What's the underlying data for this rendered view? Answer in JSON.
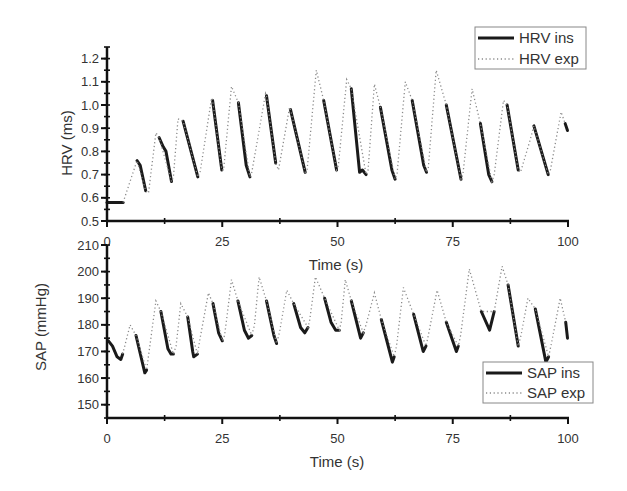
{
  "chart_data": [
    {
      "type": "line",
      "title": "",
      "xlabel": "Time (s)",
      "ylabel": "HRV (ms)",
      "xlim": [
        0,
        100
      ],
      "ylim": [
        0.5,
        1.25
      ],
      "x_ticks": [
        "0",
        "25",
        "50",
        "75",
        "100"
      ],
      "y_ticks": [
        "0.5",
        "0.6",
        "0.7",
        "0.8",
        "0.9",
        "1.0",
        "1.1",
        "1.2"
      ],
      "grid": false,
      "legend_position": "top-right",
      "series": [
        {
          "name": "HRV ins",
          "style": "solid",
          "segments": [
            [
              [
                0,
                0.58
              ],
              [
                3.5,
                0.58
              ]
            ],
            [
              [
                6.5,
                0.76
              ],
              [
                7.2,
                0.74
              ],
              [
                8.4,
                0.63
              ]
            ],
            [
              [
                11.3,
                0.86
              ],
              [
                12.2,
                0.82
              ],
              [
                12.8,
                0.8
              ],
              [
                14.0,
                0.67
              ]
            ],
            [
              [
                16.5,
                0.93
              ],
              [
                19.7,
                0.69
              ]
            ],
            [
              [
                22.9,
                1.02
              ],
              [
                24.9,
                0.72
              ]
            ],
            [
              [
                28.5,
                1.01
              ],
              [
                30.2,
                0.74
              ],
              [
                31.0,
                0.69
              ]
            ],
            [
              [
                34.6,
                1.04
              ],
              [
                36.6,
                0.75
              ]
            ],
            [
              [
                39.8,
                0.98
              ],
              [
                43.0,
                0.71
              ]
            ],
            [
              [
                47.0,
                1.02
              ],
              [
                49.8,
                0.72
              ]
            ],
            [
              [
                53.0,
                1.07
              ],
              [
                54.8,
                0.71
              ],
              [
                55.4,
                0.72
              ],
              [
                56.2,
                0.7
              ]
            ],
            [
              [
                59.3,
                0.99
              ],
              [
                61.8,
                0.72
              ],
              [
                62.5,
                0.68
              ]
            ],
            [
              [
                66.2,
                1.02
              ],
              [
                68.7,
                0.74
              ],
              [
                69.3,
                0.71
              ]
            ],
            [
              [
                73.6,
                1.0
              ],
              [
                76.8,
                0.68
              ]
            ],
            [
              [
                81.0,
                0.92
              ],
              [
                82.8,
                0.7
              ],
              [
                83.5,
                0.67
              ]
            ],
            [
              [
                86.8,
                1.0
              ],
              [
                89.2,
                0.72
              ]
            ],
            [
              [
                92.6,
                0.91
              ],
              [
                95.7,
                0.7
              ]
            ],
            [
              [
                99.4,
                0.92
              ],
              [
                99.9,
                0.89
              ]
            ]
          ]
        },
        {
          "name": "HRV exp",
          "style": "dotted",
          "points": [
            [
              3.5,
              0.58
            ],
            [
              6.5,
              0.76
            ],
            [
              8.4,
              0.63
            ],
            [
              9.0,
              0.62
            ],
            [
              10.6,
              0.88
            ],
            [
              11.3,
              0.86
            ],
            [
              14.0,
              0.67
            ],
            [
              14.4,
              0.69
            ],
            [
              15.4,
              0.94
            ],
            [
              16.5,
              0.93
            ],
            [
              19.7,
              0.69
            ],
            [
              20.2,
              0.71
            ],
            [
              22.7,
              1.03
            ],
            [
              22.9,
              1.02
            ],
            [
              24.9,
              0.72
            ],
            [
              25.3,
              0.72
            ],
            [
              27.0,
              1.08
            ],
            [
              28.5,
              1.01
            ],
            [
              31.0,
              0.69
            ],
            [
              31.4,
              0.71
            ],
            [
              34.4,
              1.05
            ],
            [
              34.6,
              1.04
            ],
            [
              36.6,
              0.75
            ],
            [
              37.2,
              0.72
            ],
            [
              39.6,
              0.99
            ],
            [
              39.8,
              0.98
            ],
            [
              43.0,
              0.71
            ],
            [
              43.4,
              0.72
            ],
            [
              45.4,
              1.15
            ],
            [
              47.0,
              1.02
            ],
            [
              49.8,
              0.72
            ],
            [
              50.2,
              0.74
            ],
            [
              52.0,
              1.11
            ],
            [
              53.0,
              1.07
            ],
            [
              56.2,
              0.7
            ],
            [
              56.6,
              0.71
            ],
            [
              58.0,
              1.09
            ],
            [
              59.3,
              0.99
            ],
            [
              62.5,
              0.68
            ],
            [
              62.9,
              0.7
            ],
            [
              64.7,
              1.1
            ],
            [
              66.2,
              1.02
            ],
            [
              69.3,
              0.71
            ],
            [
              69.7,
              0.73
            ],
            [
              71.4,
              1.15
            ],
            [
              73.6,
              1.0
            ],
            [
              76.8,
              0.68
            ],
            [
              77.2,
              0.7
            ],
            [
              79.2,
              1.07
            ],
            [
              81.0,
              0.92
            ],
            [
              83.5,
              0.67
            ],
            [
              84.0,
              0.7
            ],
            [
              86.0,
              1.02
            ],
            [
              86.8,
              1.0
            ],
            [
              89.2,
              0.72
            ],
            [
              89.7,
              0.71
            ],
            [
              91.8,
              0.85
            ],
            [
              92.6,
              0.91
            ],
            [
              95.7,
              0.7
            ],
            [
              96.1,
              0.71
            ],
            [
              98.5,
              0.97
            ],
            [
              99.4,
              0.92
            ]
          ]
        }
      ]
    },
    {
      "type": "line",
      "title": "",
      "xlabel": "Time (s)",
      "ylabel": "SAP (mmHg)",
      "xlim": [
        0,
        100
      ],
      "ylim": [
        145,
        210
      ],
      "x_ticks": [
        "0",
        "25",
        "50",
        "75",
        "100"
      ],
      "y_ticks": [
        "150",
        "160",
        "170",
        "180",
        "190",
        "200",
        "210"
      ],
      "grid": false,
      "legend_position": "bottom-right",
      "series": [
        {
          "name": "SAP ins",
          "style": "solid",
          "segments": [
            [
              [
                0.3,
                174
              ],
              [
                1.2,
                172
              ],
              [
                2.2,
                168
              ],
              [
                3.0,
                167
              ],
              [
                3.4,
                169
              ]
            ],
            [
              [
                6.3,
                176
              ],
              [
                8.2,
                162
              ],
              [
                8.6,
                163
              ]
            ],
            [
              [
                11.7,
                185
              ],
              [
                13.2,
                171
              ],
              [
                13.9,
                169
              ],
              [
                14.4,
                169
              ]
            ],
            [
              [
                17.5,
                183
              ],
              [
                18.6,
                170
              ],
              [
                18.8,
                168
              ],
              [
                19.6,
                169
              ]
            ],
            [
              [
                23.0,
                188
              ],
              [
                24.2,
                177
              ],
              [
                25.0,
                174
              ]
            ],
            [
              [
                28.4,
                189
              ],
              [
                29.8,
                178
              ],
              [
                30.7,
                175
              ],
              [
                31.4,
                176
              ]
            ],
            [
              [
                34.6,
                189
              ],
              [
                36.2,
                176
              ],
              [
                36.8,
                173
              ]
            ],
            [
              [
                40.5,
                188
              ],
              [
                42.0,
                179
              ],
              [
                42.9,
                177
              ],
              [
                43.6,
                179
              ]
            ],
            [
              [
                47.2,
                190
              ],
              [
                48.6,
                181
              ],
              [
                49.6,
                178
              ],
              [
                50.4,
                178
              ]
            ],
            [
              [
                53.0,
                189
              ],
              [
                55.0,
                175
              ],
              [
                55.6,
                177
              ]
            ],
            [
              [
                59.5,
                182
              ],
              [
                61.9,
                166
              ],
              [
                62.3,
                168
              ]
            ],
            [
              [
                66.5,
                184
              ],
              [
                68.6,
                170
              ],
              [
                69.2,
                172
              ]
            ],
            [
              [
                73.6,
                181
              ],
              [
                75.8,
                170
              ],
              [
                76.2,
                172
              ]
            ],
            [
              [
                81.2,
                185
              ],
              [
                83.0,
                178
              ],
              [
                84.0,
                185
              ]
            ],
            [
              [
                87.0,
                195
              ],
              [
                89.2,
                172
              ]
            ],
            [
              [
                92.9,
                186
              ],
              [
                95.2,
                166
              ],
              [
                95.8,
                168
              ]
            ],
            [
              [
                99.5,
                181
              ],
              [
                99.9,
                175
              ]
            ]
          ]
        },
        {
          "name": "SAP exp",
          "style": "dotted",
          "points": [
            [
              3.4,
              169
            ],
            [
              5.0,
              180
            ],
            [
              6.3,
              176
            ],
            [
              8.6,
              163
            ],
            [
              10.6,
              189
            ],
            [
              11.7,
              185
            ],
            [
              14.4,
              169
            ],
            [
              15.0,
              172
            ],
            [
              16.0,
              188
            ],
            [
              17.5,
              183
            ],
            [
              19.6,
              169
            ],
            [
              20.3,
              176
            ],
            [
              22.0,
              192
            ],
            [
              23.0,
              188
            ],
            [
              25.0,
              174
            ],
            [
              25.5,
              176
            ],
            [
              27.0,
              197
            ],
            [
              28.4,
              189
            ],
            [
              31.4,
              176
            ],
            [
              32.0,
              180
            ],
            [
              33.0,
              198
            ],
            [
              34.6,
              189
            ],
            [
              36.8,
              173
            ],
            [
              37.4,
              177
            ],
            [
              39.0,
              193
            ],
            [
              40.5,
              188
            ],
            [
              43.6,
              179
            ],
            [
              44.0,
              182
            ],
            [
              45.2,
              198
            ],
            [
              47.2,
              190
            ],
            [
              50.4,
              178
            ],
            [
              50.8,
              181
            ],
            [
              51.7,
              197
            ],
            [
              53.0,
              189
            ],
            [
              55.6,
              177
            ],
            [
              56.2,
              180
            ],
            [
              58.0,
              192
            ],
            [
              59.5,
              182
            ],
            [
              62.3,
              168
            ],
            [
              62.8,
              172
            ],
            [
              64.3,
              194
            ],
            [
              66.5,
              184
            ],
            [
              69.2,
              172
            ],
            [
              69.7,
              176
            ],
            [
              71.6,
              193
            ],
            [
              73.6,
              181
            ],
            [
              76.2,
              172
            ],
            [
              76.7,
              176
            ],
            [
              78.6,
              201
            ],
            [
              81.2,
              185
            ],
            [
              84.0,
              185
            ],
            [
              85.7,
              202
            ],
            [
              87.0,
              195
            ],
            [
              89.2,
              172
            ],
            [
              89.8,
              176
            ],
            [
              91.3,
              190
            ],
            [
              92.9,
              186
            ],
            [
              95.8,
              168
            ],
            [
              96.3,
              172
            ],
            [
              98.3,
              190
            ],
            [
              99.5,
              181
            ]
          ]
        }
      ]
    }
  ]
}
